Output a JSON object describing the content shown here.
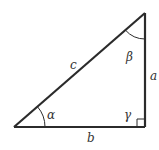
{
  "diagram": {
    "colors": {
      "stroke": "#2b2b2b",
      "text": "#333333",
      "background": "#ffffff"
    },
    "vertices": {
      "A": {
        "x": 14,
        "y": 127,
        "angle_label": "α"
      },
      "C": {
        "x": 145,
        "y": 127,
        "angle_label": "γ",
        "right_angle": true
      },
      "B": {
        "x": 145,
        "y": 13,
        "angle_label": "β"
      }
    },
    "sides": {
      "a": {
        "label": "a",
        "between": [
          "B",
          "C"
        ]
      },
      "b": {
        "label": "b",
        "between": [
          "A",
          "C"
        ]
      },
      "c": {
        "label": "c",
        "between": [
          "A",
          "B"
        ]
      }
    },
    "labels": {
      "side_a": "a",
      "side_b": "b",
      "side_c": "c",
      "angle_alpha": "α",
      "angle_beta": "β",
      "angle_gamma": "γ"
    }
  }
}
